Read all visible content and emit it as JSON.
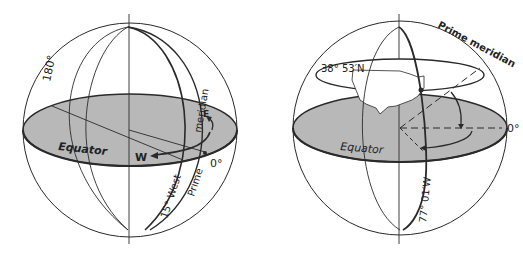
{
  "figures": [
    {
      "id": "longitude-globe",
      "labels": {
        "antimeridian": "180°",
        "equator": "Equator",
        "west": "W",
        "east": "E",
        "prime_zero": "0°",
        "meridian_word": "meridian",
        "prime_word": "Prime",
        "fifteen_west": "15° West"
      }
    },
    {
      "id": "washington-globe",
      "labels": {
        "latitude": "38° 53′N",
        "prime_meridian": "Prime meridian",
        "zero": "0°",
        "equator": "Equator",
        "longitude": "77° 01′W"
      }
    }
  ],
  "colors": {
    "equator_plane": "#b8b8b8",
    "line": "#2a2a2a",
    "background": "#ffffff"
  }
}
